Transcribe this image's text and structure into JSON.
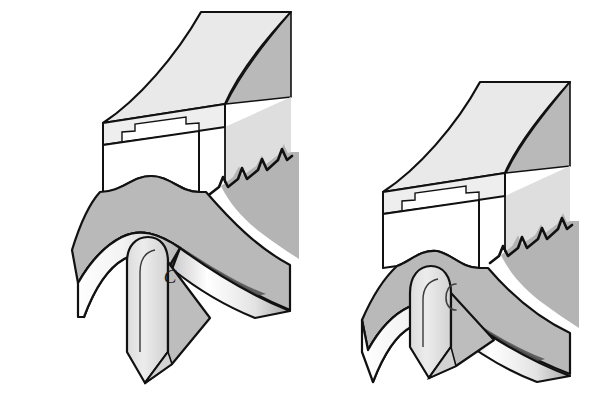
{
  "figure": {
    "background_color": "#ffffff",
    "width": 594,
    "height": 416,
    "panel_count": 2
  },
  "palette": {
    "outline": "#111111",
    "white": "#ffffff",
    "light_gray": "#e9e9e9",
    "mid_light_gray": "#d6d6d6",
    "mid_gray": "#b9b9b9",
    "dark_gray": "#8c8c8c",
    "darker_gray": "#6e6e6e",
    "shadow_gray": "#5a5a5a"
  },
  "panels": [
    {
      "id": "left-panel",
      "name": "stage-one-disengaged",
      "caption": "",
      "annotations": [
        {
          "id": "label-c-left",
          "text": "C",
          "x": 170,
          "y": 283
        }
      ],
      "components": {
        "upper_tool": {
          "name": "upper-die-block",
          "serration_count": 5,
          "has_stepped_recess": true,
          "has_arch_relief": true
        },
        "workpiece": {
          "name": "sheet-workpiece",
          "shape": "wavy-band"
        },
        "center_pin": {
          "name": "center-pin",
          "engagement": "shallow"
        }
      }
    },
    {
      "id": "right-panel",
      "name": "stage-two-engaged",
      "caption": "",
      "annotations": [
        {
          "id": "label-c-right",
          "text": "",
          "x": 452,
          "y": 290
        }
      ],
      "components": {
        "upper_tool": {
          "name": "upper-die-block",
          "serration_count": 5,
          "has_stepped_recess": true,
          "has_arch_relief": true
        },
        "workpiece": {
          "name": "sheet-workpiece",
          "shape": "wavy-band"
        },
        "center_pin": {
          "name": "center-pin",
          "engagement": "deep"
        }
      }
    }
  ]
}
